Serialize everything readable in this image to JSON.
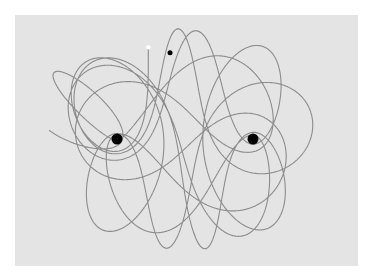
{
  "figure": {
    "colors": {
      "background": "#e4e4e4",
      "trajectory": "#8c8c8c",
      "mass": "#000000",
      "start_marker": "#ffffff",
      "end_marker": "#000000"
    },
    "masses": [
      {
        "name": "mass-1",
        "x": -1.0,
        "y": 0.0,
        "m": 1.0
      },
      {
        "name": "mass-2",
        "x": 1.0,
        "y": 0.0,
        "m": 1.0
      }
    ],
    "particle": {
      "start": {
        "x": -0.54,
        "y": 1.35
      },
      "end": {
        "x": -0.22,
        "y": 1.27
      }
    },
    "domain": {
      "x": [
        -2.0,
        3.3
      ],
      "y": [
        -1.65,
        1.85
      ]
    }
  }
}
